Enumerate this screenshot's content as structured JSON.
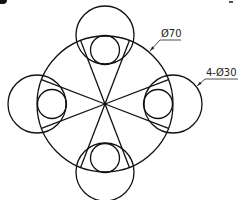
{
  "figure": {
    "type": "technical-drawing",
    "stroke_color": "#111111",
    "background": "#ffffff",
    "main_circle": {
      "cx": 105,
      "cy": 104,
      "r": 68
    },
    "outer_circles": [
      {
        "name": "top",
        "cx": 105,
        "cy": 35,
        "r": 29
      },
      {
        "name": "left",
        "cx": 37,
        "cy": 104,
        "r": 29
      },
      {
        "name": "right",
        "cx": 173,
        "cy": 104,
        "r": 29
      },
      {
        "name": "bottom",
        "cx": 105,
        "cy": 172,
        "r": 29
      }
    ],
    "inner_circles": [
      {
        "name": "top",
        "cx": 105,
        "cy": 50,
        "r": 14.5
      },
      {
        "name": "left",
        "cx": 52,
        "cy": 104,
        "r": 14.5
      },
      {
        "name": "right",
        "cx": 158,
        "cy": 104,
        "r": 14.5
      },
      {
        "name": "bottom",
        "cx": 105,
        "cy": 158,
        "r": 14.5
      }
    ],
    "tangent_line_half_angle_deg": 21
  },
  "annotations": {
    "main_diameter": {
      "label": "Ø70",
      "arrow_tip": [
        150,
        51
      ],
      "elbow": [
        160,
        40
      ],
      "underline_end": [
        181,
        40
      ],
      "text_pos": [
        161,
        37
      ]
    },
    "hole_diameter": {
      "label": "4-Ø30",
      "arrow_tip": [
        197,
        86
      ],
      "elbow": [
        205,
        79
      ],
      "underline_end": [
        238,
        79
      ],
      "text_pos": [
        206,
        76
      ]
    }
  }
}
